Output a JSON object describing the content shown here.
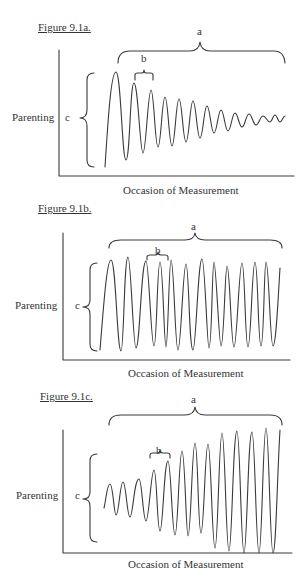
{
  "figures": [
    {
      "title": "Figure 9.1a.",
      "y_label": "Parenting",
      "x_label": "Occasion of Measurement",
      "brace_labels": {
        "a": "a",
        "b": "b",
        "c": "c"
      },
      "description": "Damped oscillation: amplitude decreases over occasions"
    },
    {
      "title": "Figure 9.1b.",
      "y_label": "Parenting",
      "x_label": "Occasion of Measurement",
      "brace_labels": {
        "a": "a",
        "b": "b",
        "c": "c"
      },
      "description": "Sustained oscillation: constant amplitude over occasions"
    },
    {
      "title": "Figure 9.1c.",
      "y_label": "Parenting",
      "x_label": "Occasion of Measurement",
      "brace_labels": {
        "a": "a",
        "b": "b",
        "c": "c"
      },
      "description": "Amplifying oscillation: amplitude increases over occasions"
    }
  ],
  "line_color": "#3a3a3a"
}
